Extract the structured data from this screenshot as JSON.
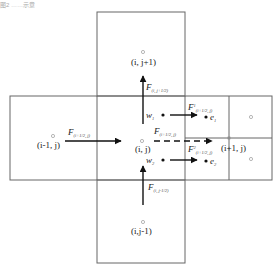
{
  "caption": "图2  ……示意",
  "cells": {
    "top": "(i, j+1)",
    "left": "(i-1, j)",
    "center": "(i, j)",
    "right": "(i+1, j)",
    "bottom": "(i,j-1)"
  },
  "fluxes": {
    "top": {
      "main": "F",
      "sub": "(i, j+1/2)"
    },
    "left": {
      "main": "F",
      "sub": "(i+1/2, j)"
    },
    "center": {
      "main": "F",
      "sub": "(i+1/2, j)"
    },
    "upper_right": {
      "main": "F",
      "sup": "1",
      "sub": "(i+1/2, j)"
    },
    "lower_right": {
      "main": "F",
      "sup": "2",
      "sub": "(i+1/2, j)"
    },
    "bottom": {
      "main": "F",
      "sub": "(i, j-1/2)"
    }
  },
  "points": {
    "w1": "w",
    "w1_sub": "1",
    "w2": "w",
    "w2_sub": "2",
    "e1": "e",
    "e1_sub": "1",
    "e2": "e",
    "e2_sub": "2"
  },
  "colors": {
    "grid": "#666666",
    "arrow": "#111111",
    "node": "#999999"
  }
}
